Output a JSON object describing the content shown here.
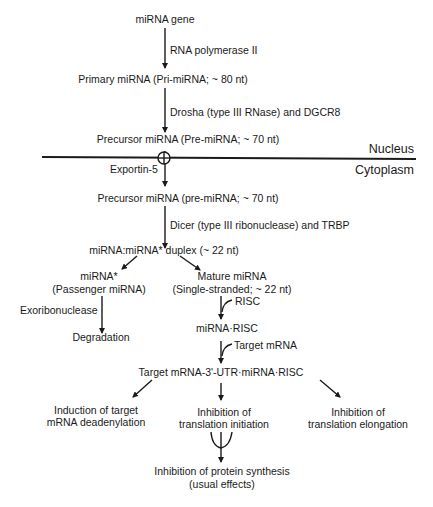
{
  "diagram": {
    "nodes": {
      "mirna_gene": "miRNA gene",
      "pri_mirna": "Primary miRNA (Pri-miRNA; ~ 80 nt)",
      "pre_mirna_nucleus": "Precursor miRNA (Pre-miRNA; ~ 70 nt)",
      "pre_mirna_cytoplasm": "Precursor miRNA (pre-miRNA; ~ 70 nt)",
      "duplex": "miRNA:miRNA* duplex (~ 22 nt)",
      "passenger_line1": "miRNA*",
      "passenger_line2": "(Passenger miRNA)",
      "mature_line1": "Mature miRNA",
      "mature_line2": "(Single-stranded; ~ 22 nt)",
      "degradation": "Degradation",
      "mirna_risc": "miRNA·RISC",
      "target_complex": "Target mRNA-3'-UTR·miRNA·RISC",
      "deadenylation_line1": "Induction of target",
      "deadenylation_line2": "mRNA deadenylation",
      "initiation_line1": "Inhibition of",
      "initiation_line2": "translation initiation",
      "elongation_line1": "Inhibition of",
      "elongation_line2": "translation elongation",
      "protein_line1": "Inhibition of protein synthesis",
      "protein_line2": "(usual effects)"
    },
    "edge_labels": {
      "rna_pol": "RNA polymerase II",
      "drosha": "Drosha (type III RNase) and DGCR8",
      "exportin": "Exportin-5",
      "dicer": "Dicer (type III ribonuclease) and TRBP",
      "exoribonuclease": "Exoribonuclease",
      "risc": "RISC",
      "target_mrna": "Target mRNA"
    },
    "compartments": {
      "nucleus": "Nucleus",
      "cytoplasm": "Cytoplasm"
    }
  }
}
